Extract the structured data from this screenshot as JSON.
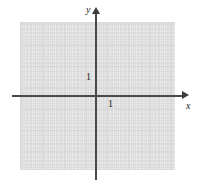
{
  "figure": {
    "kind": "cartesian-coordinate-grid",
    "background_color": "#ffffff"
  },
  "axes": {
    "x": {
      "label": "x",
      "color": "#4a4a4a",
      "has_arrowhead": true,
      "arrow_direction": "right"
    },
    "y": {
      "label": "y",
      "color": "#4a4a4a",
      "has_arrowhead": true,
      "arrow_direction": "up"
    }
  },
  "tick_labels": {
    "x_unit": "1",
    "y_unit": "1"
  },
  "grid": {
    "major_color": "#d8d8d8",
    "minor_color": "#cfcfcf",
    "major_spacing_px": 21.33,
    "minor_per_major": 5,
    "visible": true
  },
  "chart_data": {
    "type": "scatter",
    "title": "",
    "xlabel": "x",
    "ylabel": "y",
    "xlim": [
      -3.6,
      3.7
    ],
    "ylim": [
      -3.5,
      3.5
    ],
    "xticks": [
      -3,
      -2,
      -1,
      0,
      1,
      2,
      3
    ],
    "yticks": [
      -3,
      -2,
      -1,
      0,
      1,
      2,
      3
    ],
    "tick_labels_shown": [
      "1"
    ],
    "grid": true,
    "legend": null,
    "series": [],
    "annotations": [
      {
        "text": "1",
        "axis": "y",
        "value": 1
      },
      {
        "text": "1",
        "axis": "x",
        "value": 1
      }
    ]
  }
}
